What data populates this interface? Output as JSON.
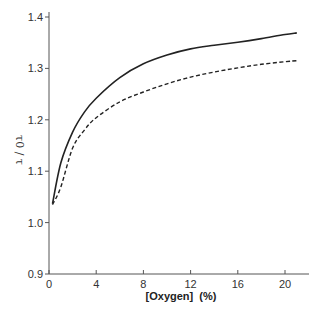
{
  "chart_data": {
    "type": "line",
    "title": "",
    "xlabel": "[Oxygen]  (%)",
    "ylabel": "τ0 / τ",
    "xlim": [
      0,
      22
    ],
    "ylim": [
      0.9,
      1.4
    ],
    "xticks": [
      0,
      4,
      8,
      12,
      16,
      20
    ],
    "yticks": [
      0.9,
      1.0,
      1.1,
      1.2,
      1.3,
      1.4
    ],
    "xtick_labels": [
      "0",
      "4",
      "8",
      "12",
      "16",
      "20"
    ],
    "ytick_labels": [
      "0.9",
      "1.0",
      "1.1",
      "1.2",
      "1.3",
      "1.4"
    ],
    "grid": false,
    "legend": null,
    "series": [
      {
        "name": "solid",
        "style": "solid",
        "color": "#222222",
        "x": [
          0.3,
          1,
          2,
          3,
          4,
          6,
          8,
          10,
          12,
          14,
          16,
          18,
          20,
          21
        ],
        "y": [
          1.037,
          1.116,
          1.176,
          1.215,
          1.242,
          1.282,
          1.309,
          1.326,
          1.338,
          1.345,
          1.351,
          1.358,
          1.366,
          1.369
        ]
      },
      {
        "name": "dashed",
        "style": "dashed",
        "color": "#222222",
        "x": [
          0.3,
          1,
          2,
          3,
          4,
          6,
          8,
          10,
          12,
          14,
          16,
          18,
          20,
          21
        ],
        "y": [
          1.035,
          1.069,
          1.145,
          1.18,
          1.204,
          1.235,
          1.254,
          1.27,
          1.283,
          1.293,
          1.301,
          1.308,
          1.313,
          1.315
        ]
      }
    ]
  }
}
